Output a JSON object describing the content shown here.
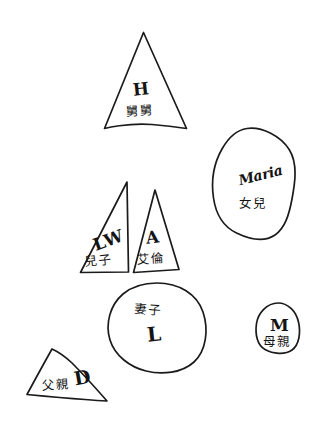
{
  "diagram": {
    "background_color": "#ffffff",
    "ink_color": "#1b1b1b",
    "width": 318,
    "height": 435,
    "nodes": [
      {
        "id": "uncle",
        "shape": "triangle",
        "initial": "H",
        "kinship": "舅舅",
        "position": "top-center"
      },
      {
        "id": "daughter",
        "shape": "oval",
        "initial": "Maria",
        "kinship": "女兒",
        "position": "right-upper"
      },
      {
        "id": "son",
        "shape": "triangle",
        "initial": "LW",
        "kinship": "兒子",
        "position": "middle-left"
      },
      {
        "id": "alan",
        "shape": "triangle",
        "initial": "A",
        "kinship": "艾倫",
        "position": "middle-center"
      },
      {
        "id": "wife",
        "shape": "circle",
        "initial": "L",
        "kinship": "妻子",
        "position": "center-lower"
      },
      {
        "id": "mother",
        "shape": "oval",
        "initial": "M",
        "kinship": "母親",
        "position": "right-lower"
      },
      {
        "id": "father",
        "shape": "triangle",
        "initial": "D",
        "kinship": "父親",
        "position": "bottom-left"
      }
    ]
  }
}
